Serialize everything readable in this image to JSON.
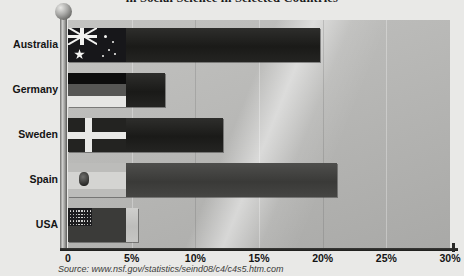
{
  "chart_data": {
    "type": "bar",
    "orientation": "horizontal",
    "title": "in Social Science in Selected Countries",
    "title_note": "top of title clipped by image edge",
    "xlabel": "",
    "ylabel": "",
    "categories": [
      "Australia",
      "Germany",
      "Sweden",
      "Spain",
      "USA"
    ],
    "values": [
      19.8,
      7.6,
      12.2,
      21.1,
      5.5
    ],
    "value_unit": "%",
    "xlim": [
      0,
      30
    ],
    "xticks": [
      0,
      5,
      10,
      15,
      20,
      25,
      30
    ],
    "xticklabels": [
      "0",
      "5%",
      "10%",
      "15%",
      "20%",
      "25%",
      "30%"
    ],
    "grid": true,
    "legend": false,
    "series": [
      {
        "name": "Share",
        "values": [
          19.8,
          7.6,
          12.2,
          21.1,
          5.5
        ]
      }
    ],
    "bar_flags": [
      "australia",
      "germany",
      "sweden",
      "spain",
      "usa"
    ],
    "annotations": []
  },
  "axis": {
    "ticks": [
      {
        "label": "0",
        "value": 0
      },
      {
        "label": "5%",
        "value": 5
      },
      {
        "label": "10%",
        "value": 10
      },
      {
        "label": "15%",
        "value": 15
      },
      {
        "label": "20%",
        "value": 20
      },
      {
        "label": "25%",
        "value": 25
      },
      {
        "label": "30%",
        "value": 30
      }
    ]
  },
  "bars": [
    {
      "country": "Australia",
      "value": 19.8,
      "flag": "australia-flag",
      "tone": "dark"
    },
    {
      "country": "Germany",
      "value": 7.6,
      "flag": "germany-flag",
      "tone": "dark"
    },
    {
      "country": "Sweden",
      "value": 12.2,
      "flag": "sweden-flag",
      "tone": "dark"
    },
    {
      "country": "Spain",
      "value": 21.1,
      "flag": "spain-flag",
      "tone": "mid"
    },
    {
      "country": "USA",
      "value": 5.5,
      "flag": "usa-flag",
      "tone": "grey"
    }
  ],
  "footer": {
    "source": "Source: www.nsf.gov/statistics/seind08/c4/c4s5.htm.com"
  },
  "colors": {
    "plot_background": "#b9b9b7",
    "bar_dark": "#1f1f1d",
    "bar_mid": "#454543",
    "bar_grey": "#c6c6c4",
    "axis": "#2a2a28",
    "text": "#141414"
  }
}
